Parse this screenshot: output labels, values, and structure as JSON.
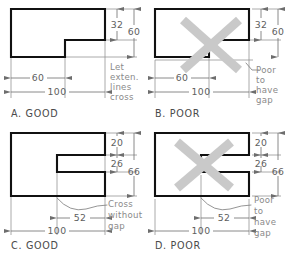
{
  "figure": {
    "colors": {
      "object_line": "#111111",
      "thin_line": "#8d8d8d",
      "dimension_line": "#6d6d6d",
      "x_mark": "#c9c9c9",
      "background": "#ffffff"
    }
  },
  "panels": [
    {
      "id": "a",
      "caption": "A.  GOOD",
      "shape": "l-shape-notch-bottom-right",
      "has_x_mark": false,
      "dimensions": [
        {
          "name": "vertical-32",
          "value": "32"
        },
        {
          "name": "vertical-60",
          "value": "60"
        },
        {
          "name": "horizontal-60",
          "value": "60"
        },
        {
          "name": "horizontal-100",
          "value": "100"
        }
      ],
      "note": {
        "lines": [
          "Let",
          "exten.",
          "lines",
          "cross"
        ]
      }
    },
    {
      "id": "b",
      "caption": "B.  POOR",
      "shape": "l-shape-notch-bottom-right",
      "has_x_mark": true,
      "dimensions": [
        {
          "name": "vertical-32",
          "value": "32"
        },
        {
          "name": "vertical-60",
          "value": "60"
        },
        {
          "name": "horizontal-60",
          "value": "60"
        },
        {
          "name": "horizontal-100",
          "value": "100"
        }
      ],
      "note": {
        "lines": [
          "Poor",
          "to",
          "have",
          "gap"
        ]
      }
    },
    {
      "id": "c",
      "caption": "C.  GOOD",
      "shape": "c-shape-slot-right",
      "has_x_mark": false,
      "dimensions": [
        {
          "name": "vertical-20",
          "value": "20"
        },
        {
          "name": "vertical-26",
          "value": "26"
        },
        {
          "name": "vertical-66",
          "value": "66"
        },
        {
          "name": "horizontal-52",
          "value": "52"
        },
        {
          "name": "horizontal-100",
          "value": "100"
        }
      ],
      "note": {
        "lines": [
          "Cross",
          "without",
          "gap"
        ]
      }
    },
    {
      "id": "d",
      "caption": "D.  POOR",
      "shape": "c-shape-slot-right",
      "has_x_mark": true,
      "dimensions": [
        {
          "name": "vertical-20",
          "value": "20"
        },
        {
          "name": "vertical-26",
          "value": "26"
        },
        {
          "name": "vertical-66",
          "value": "66"
        },
        {
          "name": "horizontal-52",
          "value": "52"
        },
        {
          "name": "horizontal-100",
          "value": "100"
        }
      ],
      "note": {
        "lines": [
          "Poor",
          "to",
          "have",
          "gap"
        ]
      }
    }
  ]
}
